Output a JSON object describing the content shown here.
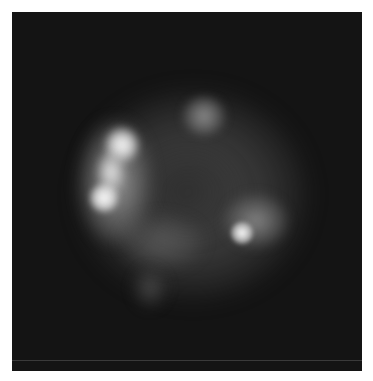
{
  "image": {
    "description": "Grayscale fluorescence microscopy image of a single cell on a dark background",
    "background_color": "#141414",
    "features": [
      {
        "name": "cell-body",
        "cx": 188,
        "cy": 190,
        "rx": 110,
        "ry": 100,
        "intensity": 0.35
      },
      {
        "name": "left-bright-crescent-upper",
        "cx": 122,
        "cy": 142,
        "rx": 16,
        "ry": 18,
        "intensity": 1.0
      },
      {
        "name": "left-bright-crescent-mid",
        "cx": 112,
        "cy": 170,
        "rx": 13,
        "ry": 20,
        "intensity": 0.9
      },
      {
        "name": "left-bright-crescent-lower",
        "cx": 104,
        "cy": 198,
        "rx": 14,
        "ry": 14,
        "intensity": 1.0
      },
      {
        "name": "top-blob",
        "cx": 203,
        "cy": 115,
        "rx": 20,
        "ry": 18,
        "intensity": 0.55
      },
      {
        "name": "lower-right-spot",
        "cx": 242,
        "cy": 233,
        "rx": 12,
        "ry": 12,
        "intensity": 0.95
      },
      {
        "name": "lower-right-glow",
        "cx": 255,
        "cy": 220,
        "rx": 30,
        "ry": 25,
        "intensity": 0.45
      },
      {
        "name": "bottom-tail",
        "cx": 150,
        "cy": 288,
        "rx": 16,
        "ry": 18,
        "intensity": 0.3
      }
    ]
  }
}
